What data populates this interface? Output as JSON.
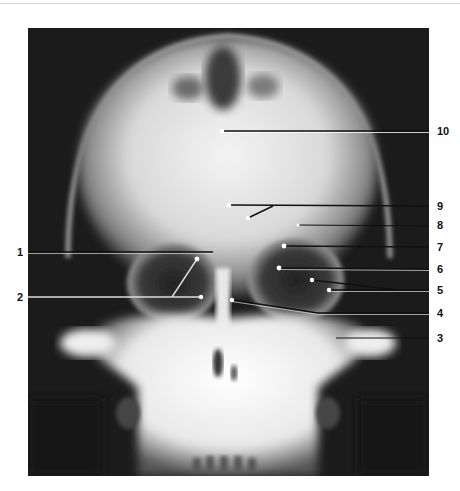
{
  "figure": {
    "kind": "frontal skull radiograph with numbered leader-line annotations",
    "colors": {
      "background": "#ffffff",
      "film": "#1a1a1a",
      "bone": "#f2f2f2",
      "leader_line": "#111111",
      "leader_highlight": "#ffffff",
      "label_text": "#111111"
    }
  },
  "labels": {
    "left": [
      {
        "number": "1",
        "y": 252
      },
      {
        "number": "2",
        "y": 297
      }
    ],
    "right": [
      {
        "number": "10",
        "y": 131
      },
      {
        "number": "9",
        "y": 206
      },
      {
        "number": "8",
        "y": 225
      },
      {
        "number": "7",
        "y": 247
      },
      {
        "number": "6",
        "y": 269
      },
      {
        "number": "5",
        "y": 290
      },
      {
        "number": "4",
        "y": 313
      },
      {
        "number": "3",
        "y": 338
      }
    ]
  },
  "caption": {
    "visible": "clipped",
    "text": ""
  }
}
